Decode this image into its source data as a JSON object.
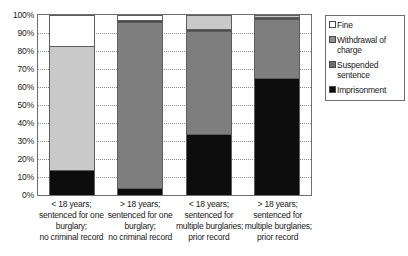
{
  "chart_data": {
    "type": "bar",
    "subtype": "stacked-100-percent",
    "title": "",
    "xlabel": "",
    "ylabel": "",
    "ylim": [
      0,
      100
    ],
    "ytick_labels": [
      "100%",
      "90%",
      "80%",
      "70%",
      "60%",
      "50%",
      "40%",
      "30%",
      "20%",
      "10%",
      "0%"
    ],
    "ytick_values": [
      100,
      90,
      80,
      70,
      60,
      50,
      40,
      30,
      20,
      10,
      0
    ],
    "grid": "horizontal-dotted",
    "legend_position": "right",
    "categories": [
      "< 18 years; sentenced for one burglary; no criminal record",
      "> 18 years; sentenced for one burglary; no criminal record",
      "< 18 years; sentenced for multiple burglaries; prior record",
      "> 18 years; sentenced for multiple burglaries; prior record"
    ],
    "category_lines": [
      [
        "< 18 years;",
        "sentenced for one",
        "burglary;",
        "no criminal record"
      ],
      [
        "> 18 years;",
        "sentenced for one",
        "burglary;",
        "no criminal record"
      ],
      [
        "< 18 years;",
        "sentenced for",
        "multiple burglaries;",
        "prior record"
      ],
      [
        "> 18 years;",
        "sentenced for",
        "multiple burglaries;",
        "prior record"
      ]
    ],
    "series": [
      {
        "name": "Imprisonment",
        "color": "#0d0d0d",
        "values": [
          14,
          4,
          34,
          65
        ]
      },
      {
        "name": "Suspended sentence",
        "color": "#7e7e7e",
        "values": [
          69,
          92,
          57,
          33
        ]
      },
      {
        "name": "Withdrawal of charge",
        "color": "#4a4a4a",
        "values": [
          0,
          1,
          1,
          1
        ]
      },
      {
        "name": "Fine",
        "color": "#ffffff",
        "values": [
          17,
          3,
          8,
          1
        ]
      }
    ],
    "bar_segment_overrides": [
      {
        "bar": 0,
        "series": "Suspended sentence",
        "color": "#c9c9c9"
      },
      {
        "bar": 2,
        "series": "Fine",
        "color": "#c9c9c9"
      },
      {
        "bar": 3,
        "series": "Fine",
        "color": "#c9c9c9"
      }
    ]
  },
  "legend": {
    "items": [
      {
        "label": "Fine",
        "swatch_color": "#ffffff"
      },
      {
        "label": "Withdrawal of charge",
        "swatch_color": "#8f8f8f"
      },
      {
        "label": "Suspended sentence",
        "swatch_color": "#6e6e6e"
      },
      {
        "label": "Imprisonment",
        "swatch_color": "#0d0d0d"
      }
    ]
  },
  "colors": {
    "axis": "#6e6e6e",
    "gridline": "#8d8d8d",
    "bar_outline": "#5d5d5d",
    "text": "#1a1a1a",
    "background": "#ffffff"
  }
}
